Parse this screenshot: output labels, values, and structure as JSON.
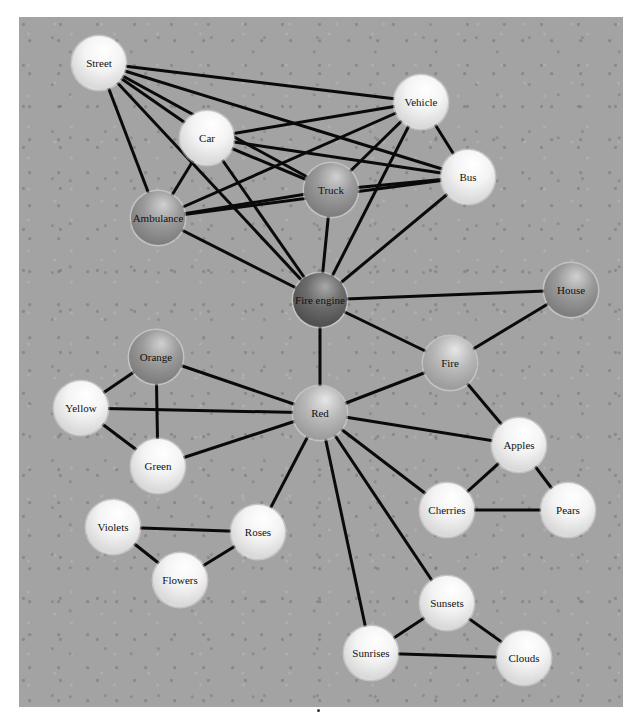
{
  "diagram": {
    "type": "semantic-network",
    "nodes": [
      {
        "id": "street",
        "label": "Street",
        "shade": "light"
      },
      {
        "id": "vehicle",
        "label": "Vehicle",
        "shade": "light"
      },
      {
        "id": "car",
        "label": "Car",
        "shade": "light"
      },
      {
        "id": "bus",
        "label": "Bus",
        "shade": "light"
      },
      {
        "id": "truck",
        "label": "Truck",
        "shade": "medium"
      },
      {
        "id": "ambulance",
        "label": "Ambulance",
        "shade": "medium"
      },
      {
        "id": "fire-engine",
        "label": "Fire engine",
        "shade": "dark"
      },
      {
        "id": "house",
        "label": "House",
        "shade": "medium"
      },
      {
        "id": "orange",
        "label": "Orange",
        "shade": "medium"
      },
      {
        "id": "fire",
        "label": "Fire",
        "shade": "medium-light"
      },
      {
        "id": "yellow",
        "label": "Yellow",
        "shade": "light"
      },
      {
        "id": "red",
        "label": "Red",
        "shade": "medium-light"
      },
      {
        "id": "apples",
        "label": "Apples",
        "shade": "light"
      },
      {
        "id": "green",
        "label": "Green",
        "shade": "light"
      },
      {
        "id": "violets",
        "label": "Violets",
        "shade": "light"
      },
      {
        "id": "roses",
        "label": "Roses",
        "shade": "light"
      },
      {
        "id": "cherries",
        "label": "Cherries",
        "shade": "light"
      },
      {
        "id": "pears",
        "label": "Pears",
        "shade": "light"
      },
      {
        "id": "flowers",
        "label": "Flowers",
        "shade": "light"
      },
      {
        "id": "sunsets",
        "label": "Sunsets",
        "shade": "light"
      },
      {
        "id": "sunrises",
        "label": "Sunrises",
        "shade": "light"
      },
      {
        "id": "clouds",
        "label": "Clouds",
        "shade": "light"
      }
    ],
    "edges": [
      [
        "street",
        "vehicle"
      ],
      [
        "street",
        "bus"
      ],
      [
        "street",
        "truck"
      ],
      [
        "street",
        "car"
      ],
      [
        "street",
        "ambulance"
      ],
      [
        "street",
        "fire-engine"
      ],
      [
        "car",
        "vehicle"
      ],
      [
        "car",
        "bus"
      ],
      [
        "car",
        "truck"
      ],
      [
        "car",
        "ambulance"
      ],
      [
        "car",
        "fire-engine"
      ],
      [
        "vehicle",
        "ambulance"
      ],
      [
        "vehicle",
        "truck"
      ],
      [
        "vehicle",
        "bus"
      ],
      [
        "vehicle",
        "fire-engine"
      ],
      [
        "ambulance",
        "truck"
      ],
      [
        "ambulance",
        "bus"
      ],
      [
        "ambulance",
        "fire-engine"
      ],
      [
        "truck",
        "bus"
      ],
      [
        "truck",
        "fire-engine"
      ],
      [
        "bus",
        "fire-engine"
      ],
      [
        "fire-engine",
        "house"
      ],
      [
        "fire-engine",
        "fire"
      ],
      [
        "fire-engine",
        "red"
      ],
      [
        "house",
        "fire"
      ],
      [
        "fire",
        "red"
      ],
      [
        "fire",
        "apples"
      ],
      [
        "orange",
        "yellow"
      ],
      [
        "orange",
        "green"
      ],
      [
        "orange",
        "red"
      ],
      [
        "yellow",
        "red"
      ],
      [
        "yellow",
        "green"
      ],
      [
        "green",
        "red"
      ],
      [
        "red",
        "apples"
      ],
      [
        "red",
        "cherries"
      ],
      [
        "red",
        "roses"
      ],
      [
        "red",
        "sunsets"
      ],
      [
        "red",
        "sunrises"
      ],
      [
        "apples",
        "cherries"
      ],
      [
        "apples",
        "pears"
      ],
      [
        "cherries",
        "pears"
      ],
      [
        "violets",
        "roses"
      ],
      [
        "violets",
        "flowers"
      ],
      [
        "roses",
        "flowers"
      ],
      [
        "sunsets",
        "sunrises"
      ],
      [
        "sunsets",
        "clouds"
      ],
      [
        "sunrises",
        "clouds"
      ]
    ],
    "shade_colors": {
      "light": {
        "highlight": "#ffffff",
        "mid": "#f4f4f4",
        "edge": "#d8d8d8"
      },
      "medium-light": {
        "highlight": "#e6e6e6",
        "mid": "#b8b8b8",
        "edge": "#9c9c9c"
      },
      "medium": {
        "highlight": "#d0d0d0",
        "mid": "#9a9a9a",
        "edge": "#7e7e7e"
      },
      "dark": {
        "highlight": "#a8a8a8",
        "mid": "#6c6c6c",
        "edge": "#505050"
      }
    },
    "background_color": "#a3a3a3",
    "edge_color": "#0a0a0a"
  }
}
